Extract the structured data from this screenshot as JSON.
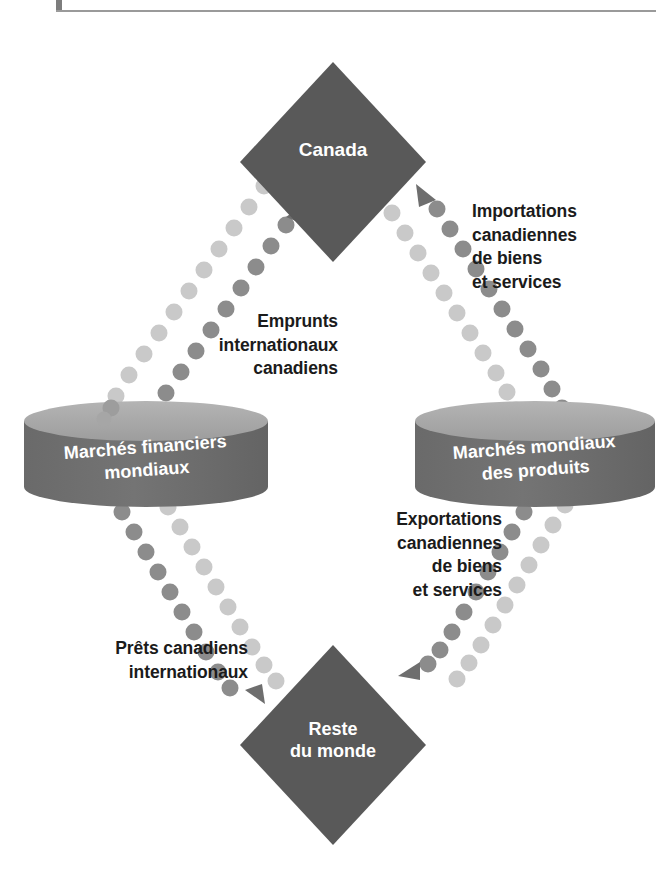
{
  "diagram": {
    "type": "flow-diagram",
    "title_visible": false,
    "colors": {
      "node_fill": "#595959",
      "cylinder_body": "#6b6b6b",
      "cylinder_top": "#a8a8a8",
      "dot_dark": "#8c8c8c",
      "dot_light": "#c9c9c9",
      "arrow_dark": "#6e6e6e",
      "arrow_light": "#bdbdbd",
      "text_dark": "#1b1b1b",
      "text_light": "#ffffff",
      "background": "#ffffff"
    },
    "nodes": [
      {
        "id": "canada",
        "shape": "diamond",
        "label": "Canada",
        "cx": 333,
        "cy": 162,
        "half_width": 93,
        "half_height": 100
      },
      {
        "id": "rest-of-world",
        "shape": "diamond",
        "label": "Reste\ndu monde",
        "cx": 333,
        "cy": 745,
        "half_width": 93,
        "half_height": 100
      },
      {
        "id": "financial-markets",
        "shape": "cylinder",
        "label": "Marchés financiers\nmondiaux",
        "cx": 146,
        "cy": 454,
        "rx": 122,
        "body_height": 66
      },
      {
        "id": "goods-markets",
        "shape": "cylinder",
        "label": "Marchés mondiaux\ndes produits",
        "cx": 535,
        "cy": 454,
        "rx": 120,
        "body_height": 66
      }
    ],
    "flows": [
      {
        "id": "imports",
        "label": "Importations\ncanadiennes\nde biens\net services",
        "from": "goods-markets",
        "to": "canada",
        "style": "dotted",
        "tone": "dark",
        "direction": "up-left"
      },
      {
        "id": "borrowings",
        "label": "Emprunts\ninternationaux\ncanadiens",
        "from": "financial-markets",
        "to": "canada",
        "style": "dotted",
        "tone": "dark",
        "direction": "up-right"
      },
      {
        "id": "exports",
        "label": "Exportations\ncanadiennes\nde biens\net services",
        "from": "goods-markets",
        "to": "rest-of-world",
        "style": "dotted",
        "tone": "dark",
        "direction": "down-left"
      },
      {
        "id": "loans",
        "label": "Prêts canadiens\ninternationaux",
        "from": "financial-markets",
        "to": "rest-of-world",
        "style": "dotted",
        "tone": "dark",
        "direction": "down-right"
      }
    ]
  }
}
